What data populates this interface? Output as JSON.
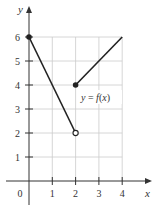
{
  "chart_data": {
    "type": "line",
    "title": "",
    "xlabel": "x",
    "ylabel": "y",
    "xlim": [
      0,
      4
    ],
    "ylim": [
      0,
      6
    ],
    "grid": true,
    "x_ticks": [
      "0",
      "1",
      "2",
      "3",
      "4"
    ],
    "y_ticks": [
      "1",
      "2",
      "3",
      "4",
      "5",
      "6"
    ],
    "annotation": "y = f(x)",
    "series": [
      {
        "name": "segment-1",
        "points": [
          [
            0,
            6
          ],
          [
            2,
            2
          ]
        ],
        "start": "closed",
        "end": "open"
      },
      {
        "name": "segment-2",
        "points": [
          [
            2,
            4
          ],
          [
            4,
            6
          ]
        ],
        "start": "closed",
        "end": "none"
      }
    ],
    "colors": {
      "line": "#222222",
      "grid": "#cccccc",
      "axis": "#333333"
    }
  }
}
